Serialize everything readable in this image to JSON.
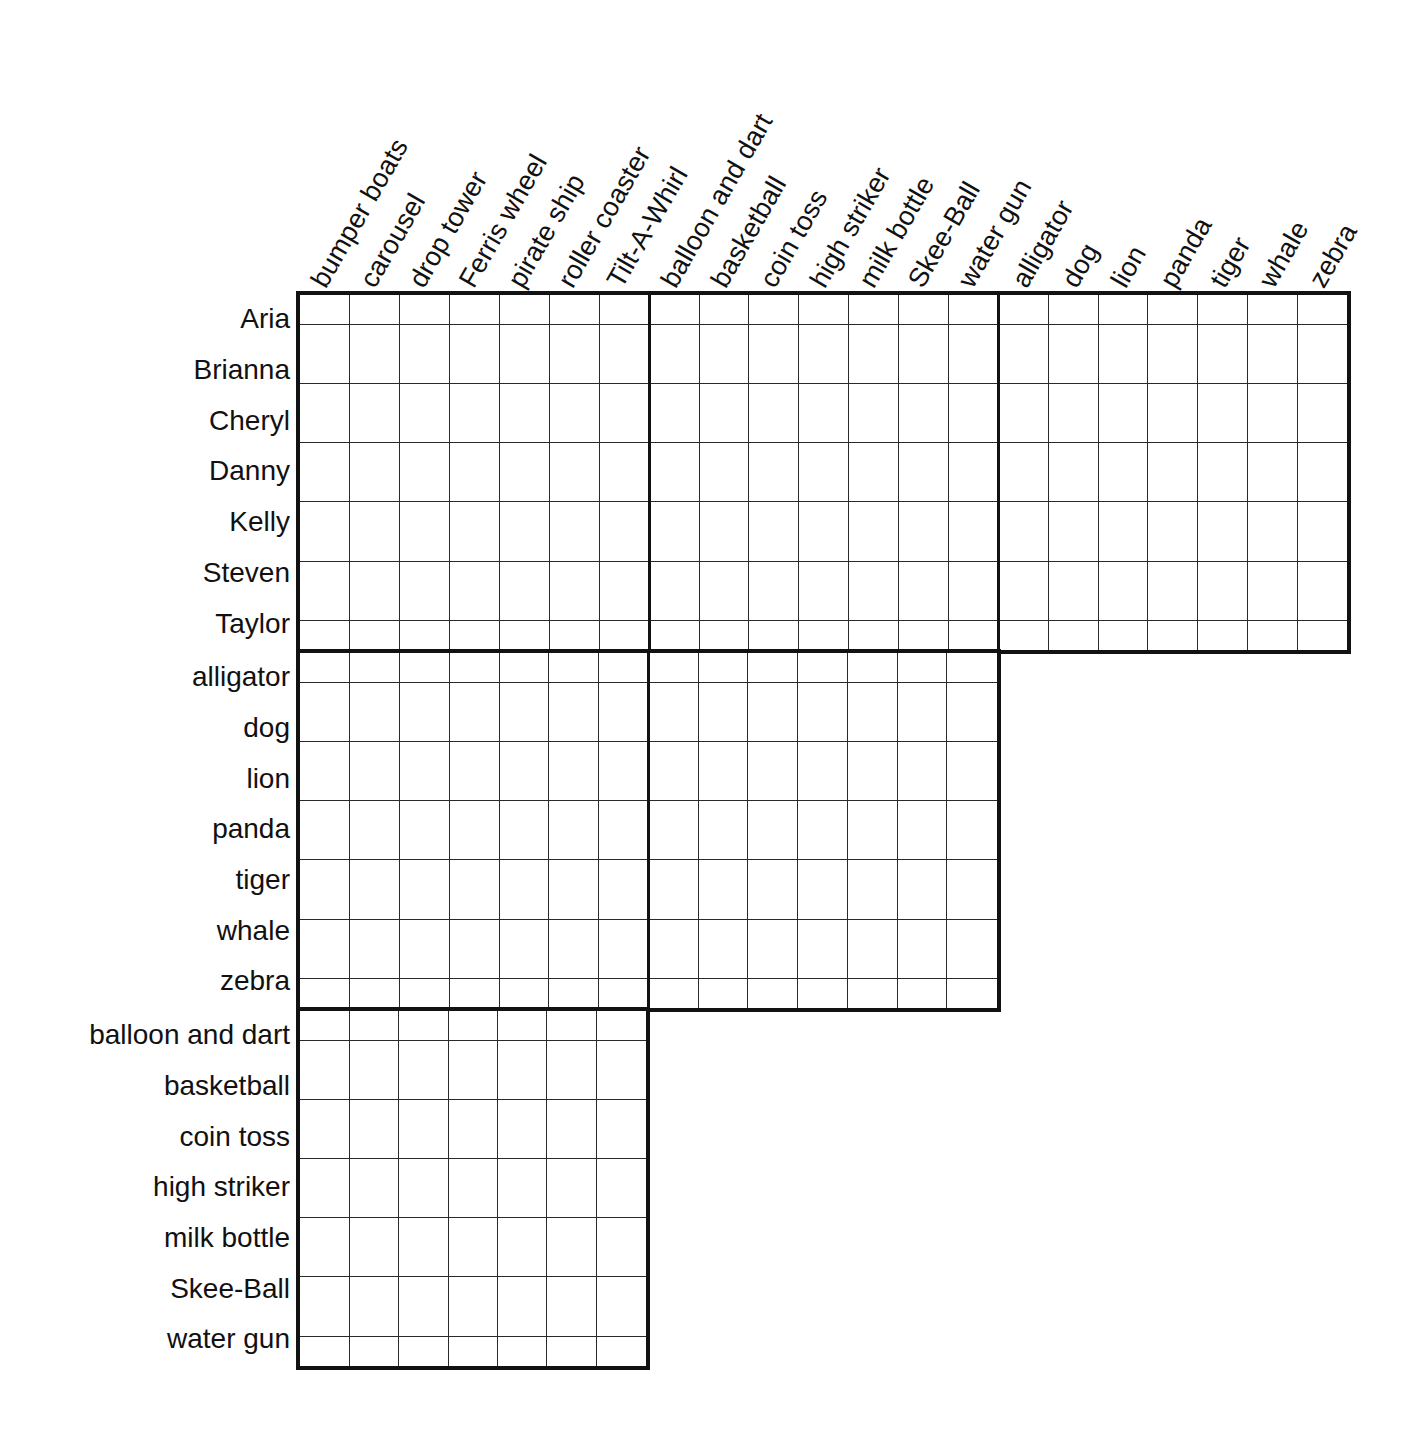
{
  "puzzle": {
    "type": "logic-grid",
    "cell_size": 49.4,
    "row_height": 50.7,
    "grid_origin": {
      "x": 300,
      "y": 295
    },
    "col_groups": [
      {
        "name": "rides",
        "labels": [
          "bumper boats",
          "carousel",
          "drop tower",
          "Ferris wheel",
          "pirate ship",
          "roller coaster",
          "Tilt-A-Whirl"
        ]
      },
      {
        "name": "carnival games",
        "labels": [
          "balloon and dart",
          "basketball",
          "coin toss",
          "high striker",
          "milk bottle",
          "Skee-Ball",
          "water gun"
        ]
      },
      {
        "name": "animals",
        "labels": [
          "alligator",
          "dog",
          "lion",
          "panda",
          "tiger",
          "whale",
          "zebra"
        ]
      }
    ],
    "row_groups": [
      {
        "name": "people",
        "labels": [
          "Aria",
          "Brianna",
          "Cheryl",
          "Danny",
          "Kelly",
          "Steven",
          "Taylor"
        ],
        "col_group_count": 3
      },
      {
        "name": "animals",
        "labels": [
          "alligator",
          "dog",
          "lion",
          "panda",
          "tiger",
          "whale",
          "zebra"
        ],
        "col_group_count": 2
      },
      {
        "name": "carnival games",
        "labels": [
          "balloon and dart",
          "basketball",
          "coin toss",
          "high striker",
          "milk bottle",
          "Skee-Ball",
          "water gun"
        ],
        "col_group_count": 1
      }
    ],
    "colors": {
      "border": "#121212",
      "cell_line": "#2a2a2a",
      "text": "#111111",
      "background": "#ffffff"
    }
  }
}
